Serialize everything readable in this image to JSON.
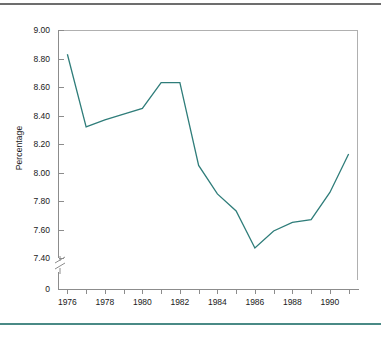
{
  "figure": {
    "frame_color": "#b0b0b0",
    "axis_color": "#8c8c8c",
    "rule_top_color": "#6d6d6d",
    "rule_bottom_color": "#4a8a86"
  },
  "chart_data": {
    "type": "line",
    "title": "",
    "xlabel": "",
    "ylabel": "Percentage",
    "line_color": "#2f7d7a",
    "grid": false,
    "legend": false,
    "axis_break": true,
    "axis_break_label": "0",
    "xlim": [
      1975.5,
      1991.5
    ],
    "ylim": [
      7.4,
      9.0
    ],
    "ytick_labels": [
      "9.00",
      "8.80",
      "8.60",
      "8.40",
      "8.20",
      "8.00",
      "7.80",
      "7.60",
      "7.40",
      "0"
    ],
    "ytick_values": [
      9.0,
      8.8,
      8.6,
      8.4,
      8.2,
      8.0,
      7.8,
      7.6,
      7.4
    ],
    "xtick_values": [
      1976,
      1977,
      1978,
      1979,
      1980,
      1981,
      1982,
      1983,
      1984,
      1985,
      1986,
      1987,
      1988,
      1989,
      1990,
      1991
    ],
    "xtick_labels": [
      "1976",
      "",
      "1978",
      "",
      "1980",
      "",
      "1982",
      "",
      "1984",
      "",
      "1986",
      "",
      "1988",
      "",
      "1990",
      ""
    ],
    "x": [
      1976,
      1977,
      1978,
      1979,
      1980,
      1981,
      1982,
      1983,
      1984,
      1985,
      1986,
      1987,
      1988,
      1989,
      1990,
      1991
    ],
    "values": [
      8.83,
      8.32,
      8.37,
      8.41,
      8.45,
      8.63,
      8.63,
      8.05,
      7.85,
      7.73,
      7.47,
      7.59,
      7.65,
      7.67,
      7.86,
      8.13
    ],
    "series": [
      {
        "name": "Percentage",
        "values": [
          8.83,
          8.32,
          8.37,
          8.41,
          8.45,
          8.63,
          8.63,
          8.05,
          7.85,
          7.73,
          7.47,
          7.59,
          7.65,
          7.67,
          7.86,
          8.13
        ]
      }
    ]
  }
}
